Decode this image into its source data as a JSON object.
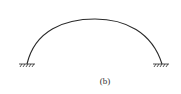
{
  "figure": {
    "caption": "(b)",
    "colors": {
      "stroke": "#2a2a2a",
      "background": "#ffffff"
    },
    "supports": [
      {
        "type": "fixed",
        "side": "left"
      },
      {
        "type": "fixed",
        "side": "right"
      }
    ]
  }
}
